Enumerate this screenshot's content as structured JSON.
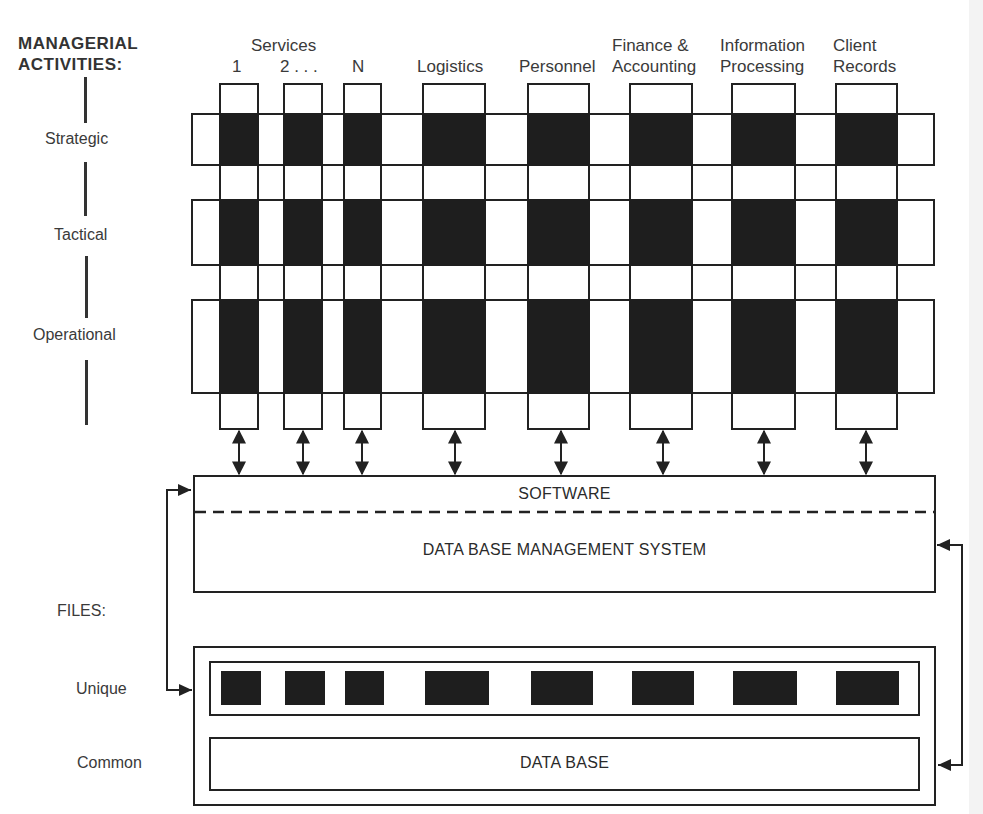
{
  "diagram": {
    "section_managerial": "MANAGERIAL",
    "section_activities": "ACTIVITIES:",
    "levels": [
      {
        "label": "Strategic"
      },
      {
        "label": "Tactical"
      },
      {
        "label": "Operational"
      }
    ],
    "services_header": "Services",
    "columns": [
      {
        "line1": "",
        "line2": "1"
      },
      {
        "line1": "",
        "line2": "2 . . ."
      },
      {
        "line1": "",
        "line2": "N"
      },
      {
        "line1": "",
        "line2": "Logistics"
      },
      {
        "line1": "",
        "line2": "Personnel"
      },
      {
        "line1": "Finance &",
        "line2": "Accounting"
      },
      {
        "line1": "Information",
        "line2": "Processing"
      },
      {
        "line1": "Client",
        "line2": "Records"
      }
    ],
    "software_label": "SOFTWARE",
    "dbms_label": "DATA BASE MANAGEMENT SYSTEM",
    "files_heading": "FILES:",
    "files_unique_label": "Unique",
    "files_common_label": "Common",
    "database_label": "DATA BASE",
    "colors": {
      "ink": "#222222",
      "fill": "#1e1e1e",
      "background": "#ffffff"
    }
  }
}
